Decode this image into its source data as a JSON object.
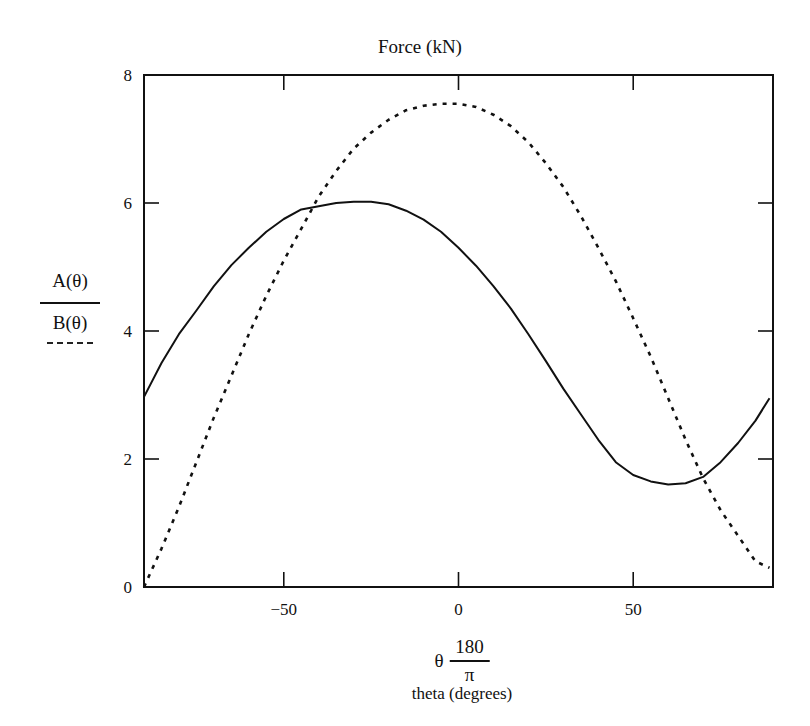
{
  "chart_data": {
    "type": "line",
    "title": "Force (kN)",
    "xlabel": "θ·180/π",
    "xlabel_sub": "theta (degrees)",
    "ylabel_numerator": "A(θ)",
    "ylabel_denominator": "B(θ)",
    "xlim": [
      -90,
      90
    ],
    "ylim": [
      0,
      8
    ],
    "x_ticks": [
      -50,
      0,
      50
    ],
    "x_tick_labels": [
      "-50",
      "0",
      "50"
    ],
    "y_ticks": [
      0,
      2,
      4,
      6,
      8
    ],
    "y_tick_labels": [
      "0",
      "2",
      "4",
      "6",
      "8"
    ],
    "grid": false,
    "legend_position": "left (as y-axis label)",
    "series": [
      {
        "name": "A(θ)",
        "style": "solid",
        "x": [
          -90,
          -85,
          -80,
          -75,
          -70,
          -65,
          -60,
          -55,
          -50,
          -45,
          -40,
          -35,
          -30,
          -25,
          -20,
          -15,
          -10,
          -5,
          0,
          5,
          10,
          15,
          20,
          25,
          30,
          35,
          40,
          45,
          50,
          55,
          60,
          65,
          70,
          75,
          80,
          85,
          89
        ],
        "values": [
          2.97,
          3.5,
          3.95,
          4.32,
          4.7,
          5.03,
          5.3,
          5.55,
          5.75,
          5.9,
          5.95,
          6.0,
          6.02,
          6.02,
          5.98,
          5.88,
          5.74,
          5.55,
          5.3,
          5.02,
          4.7,
          4.35,
          3.95,
          3.53,
          3.1,
          2.7,
          2.3,
          1.95,
          1.75,
          1.65,
          1.6,
          1.62,
          1.72,
          1.95,
          2.25,
          2.6,
          2.95
        ]
      },
      {
        "name": "B(θ)",
        "style": "dashed",
        "x": [
          -90,
          -85,
          -80,
          -75,
          -70,
          -65,
          -60,
          -55,
          -50,
          -45,
          -40,
          -35,
          -30,
          -25,
          -20,
          -15,
          -10,
          -5,
          0,
          5,
          10,
          15,
          20,
          25,
          30,
          35,
          40,
          45,
          50,
          55,
          60,
          65,
          70,
          75,
          80,
          85,
          89
        ],
        "values": [
          0.0,
          0.6,
          1.25,
          1.95,
          2.65,
          3.3,
          3.95,
          4.55,
          5.1,
          5.6,
          6.1,
          6.5,
          6.85,
          7.1,
          7.3,
          7.45,
          7.52,
          7.55,
          7.55,
          7.5,
          7.38,
          7.2,
          6.95,
          6.62,
          6.25,
          5.8,
          5.3,
          4.78,
          4.2,
          3.6,
          2.95,
          2.3,
          1.7,
          1.2,
          0.8,
          0.4,
          0.3
        ]
      }
    ],
    "colors": {
      "line": "#111111",
      "background": "#ffffff"
    }
  }
}
